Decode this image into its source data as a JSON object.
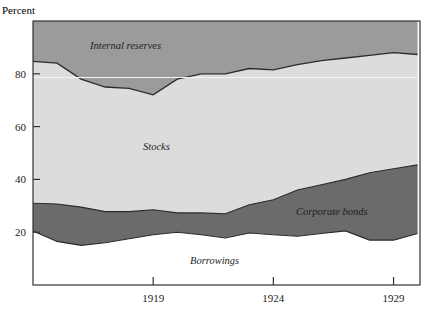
{
  "chart_data": {
    "type": "area",
    "stacked": true,
    "title": "",
    "xlabel": "",
    "ylabel": "Percent",
    "ylim": [
      0,
      100
    ],
    "xlim": [
      1914,
      1930.1
    ],
    "y_ticks": [
      20,
      40,
      60,
      80
    ],
    "x_ticks": [
      1919,
      1924,
      1929
    ],
    "grid": false,
    "legend": "inline labels",
    "x": [
      1914,
      1915,
      1916,
      1917,
      1918,
      1919,
      1920,
      1921,
      1922,
      1923,
      1924,
      1925,
      1926,
      1927,
      1928,
      1929,
      1930
    ],
    "series": [
      {
        "name": "Borrowings",
        "label": "Borrowings",
        "values": [
          20.5,
          16.5,
          15.0,
          16.0,
          17.5,
          19.0,
          20.0,
          19.0,
          17.8,
          19.7,
          19.0,
          18.5,
          19.5,
          20.5,
          17.0,
          17.0,
          19.5
        ]
      },
      {
        "name": "Corporate bonds",
        "label": "Corporate bonds",
        "values": [
          10.5,
          14.2,
          14.5,
          11.8,
          10.3,
          9.5,
          7.3,
          8.3,
          9.2,
          10.7,
          13.3,
          17.5,
          18.5,
          19.5,
          25.5,
          27.0,
          26.0
        ]
      },
      {
        "name": "Stocks",
        "label": "Stocks",
        "values": [
          53.7,
          53.3,
          48.5,
          47.2,
          47.7,
          43.5,
          50.7,
          52.7,
          53.0,
          51.6,
          49.2,
          47.5,
          47.0,
          46.0,
          44.5,
          44.0,
          41.8
        ]
      },
      {
        "name": "Internal reserves",
        "label": "Internal reserves",
        "values": [
          15.3,
          16.0,
          22.0,
          25.0,
          24.5,
          28.0,
          22.0,
          20.0,
          20.0,
          18.0,
          18.5,
          16.5,
          15.0,
          14.0,
          13.0,
          12.0,
          12.7
        ]
      }
    ],
    "boundaries_cumulative": {
      "borrowings_top": [
        20.5,
        16.5,
        15.0,
        16.0,
        17.5,
        19.0,
        20.0,
        19.0,
        17.8,
        19.7,
        19.0,
        18.5,
        19.5,
        20.5,
        17.0,
        17.0,
        19.5
      ],
      "bonds_top": [
        31.0,
        30.7,
        29.5,
        27.8,
        27.8,
        28.5,
        27.3,
        27.3,
        27.0,
        30.4,
        32.3,
        36.0,
        38.0,
        40.0,
        42.5,
        44.0,
        45.5
      ],
      "stocks_top": [
        84.7,
        84.0,
        78.0,
        75.0,
        74.5,
        72.0,
        78.0,
        80.0,
        80.0,
        82.0,
        81.5,
        83.5,
        85.0,
        86.0,
        87.0,
        88.0,
        87.3
      ]
    },
    "colors": {
      "Borrowings": "#ffffff",
      "Corporate bonds": "#6b6b6b",
      "Stocks": "#dcdcdc",
      "Internal reserves": "#9b9b9b",
      "axis": "#333333",
      "boundary_line": "#2a2a2a"
    }
  },
  "axis": {
    "y_title": "Percent",
    "y_tick_labels": [
      "80",
      "60",
      "40",
      "20"
    ],
    "x_tick_labels": [
      "1919",
      "1924",
      "1929"
    ]
  },
  "labels": {
    "internal_reserves": "Internal reserves",
    "stocks": "Stocks",
    "corporate_bonds": "Corporate bonds",
    "borrowings": "Borrowings"
  }
}
